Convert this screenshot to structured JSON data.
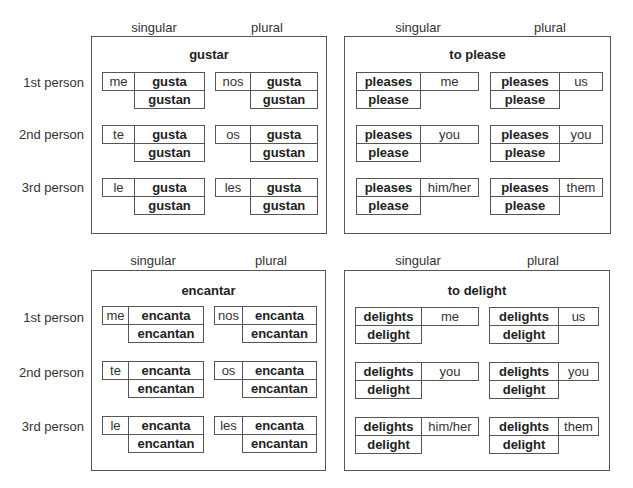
{
  "column_headers": {
    "singular": "singular",
    "plural": "plural"
  },
  "row_labels": [
    "1st person",
    "2nd person",
    "3rd person"
  ],
  "panels": {
    "gustar": {
      "title": "gustar",
      "singular": [
        {
          "pronoun": "me",
          "form1": "gusta",
          "form2": "gustan"
        },
        {
          "pronoun": "te",
          "form1": "gusta",
          "form2": "gustan"
        },
        {
          "pronoun": "le",
          "form1": "gusta",
          "form2": "gustan"
        }
      ],
      "plural": [
        {
          "pronoun": "nos",
          "form1": "gusta",
          "form2": "gustan"
        },
        {
          "pronoun": "os",
          "form1": "gusta",
          "form2": "gustan"
        },
        {
          "pronoun": "les",
          "form1": "gusta",
          "form2": "gustan"
        }
      ]
    },
    "to_please": {
      "title": "to please",
      "singular": [
        {
          "form1": "pleases",
          "object": "me",
          "form2": "please"
        },
        {
          "form1": "pleases",
          "object": "you",
          "form2": "please"
        },
        {
          "form1": "pleases",
          "object": "him/her",
          "form2": "please"
        }
      ],
      "plural": [
        {
          "form1": "pleases",
          "object": "us",
          "form2": "please"
        },
        {
          "form1": "pleases",
          "object": "you",
          "form2": "please"
        },
        {
          "form1": "pleases",
          "object": "them",
          "form2": "please"
        }
      ]
    },
    "encantar": {
      "title": "encantar",
      "singular": [
        {
          "pronoun": "me",
          "form1": "encanta",
          "form2": "encantan"
        },
        {
          "pronoun": "te",
          "form1": "encanta",
          "form2": "encantan"
        },
        {
          "pronoun": "le",
          "form1": "encanta",
          "form2": "encantan"
        }
      ],
      "plural": [
        {
          "pronoun": "nos",
          "form1": "encanta",
          "form2": "encantan"
        },
        {
          "pronoun": "os",
          "form1": "encanta",
          "form2": "encantan"
        },
        {
          "pronoun": "les",
          "form1": "encanta",
          "form2": "encantan"
        }
      ]
    },
    "to_delight": {
      "title": "to delight",
      "singular": [
        {
          "form1": "delights",
          "object": "me",
          "form2": "delight"
        },
        {
          "form1": "delights",
          "object": "you",
          "form2": "delight"
        },
        {
          "form1": "delights",
          "object": "him/her",
          "form2": "delight"
        }
      ],
      "plural": [
        {
          "form1": "delights",
          "object": "us",
          "form2": "delight"
        },
        {
          "form1": "delights",
          "object": "you",
          "form2": "delight"
        },
        {
          "form1": "delights",
          "object": "them",
          "form2": "delight"
        }
      ]
    }
  }
}
